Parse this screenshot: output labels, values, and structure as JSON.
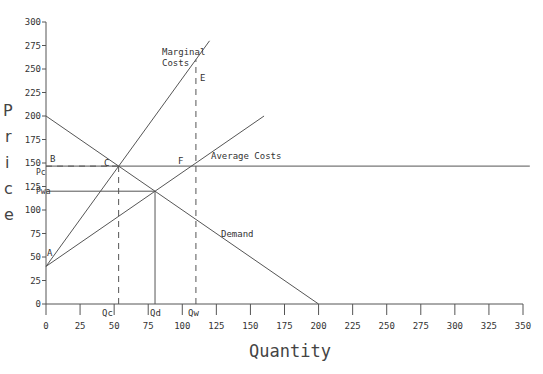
{
  "chart_data": {
    "type": "line",
    "title": "",
    "xlabel": "Quantity",
    "ylabel": "Price",
    "xlim": [
      0,
      350
    ],
    "ylim": [
      0,
      300
    ],
    "grid": false,
    "x_ticks": [
      0,
      25,
      50,
      75,
      100,
      125,
      150,
      175,
      200,
      225,
      250,
      275,
      300,
      325,
      350
    ],
    "y_ticks": [
      0,
      25,
      50,
      75,
      100,
      125,
      150,
      175,
      200,
      225,
      250,
      275,
      300
    ],
    "series": [
      {
        "name": "Marginal Costs",
        "x": [
          0,
          120
        ],
        "y": [
          40,
          280
        ]
      },
      {
        "name": "Average Costs",
        "x": [
          0,
          160
        ],
        "y": [
          40,
          200
        ]
      },
      {
        "name": "Demand",
        "x": [
          0,
          200
        ],
        "y": [
          200,
          0
        ]
      },
      {
        "name": "Pc price line",
        "x": [
          0,
          355
        ],
        "y": [
          146.7,
          146.7
        ]
      }
    ],
    "reference_lines": [
      {
        "name": "Pc",
        "type": "dashed-horizontal",
        "y": 146.7,
        "x_to": 53.3
      },
      {
        "name": "Pwa",
        "type": "solid-horizontal",
        "y": 120,
        "x_to": 80
      },
      {
        "name": "Qc",
        "type": "dashed-vertical",
        "x": 53.3,
        "y_to": 146.7
      },
      {
        "name": "Qd",
        "type": "solid-vertical",
        "x": 80,
        "y_to": 120
      },
      {
        "name": "Qw",
        "type": "dashed-vertical",
        "x": 110,
        "y_to": 260
      }
    ],
    "annotations": [
      {
        "text": "A",
        "x": 1,
        "y": 52
      },
      {
        "text": "B",
        "x": 1,
        "y": 150
      },
      {
        "text": "C",
        "x": 44,
        "y": 150
      },
      {
        "text": "E",
        "x": 113,
        "y": 243
      },
      {
        "text": "F",
        "x": 97,
        "y": 150
      },
      {
        "text": "Marginal Costs",
        "x": 85,
        "y": 258
      },
      {
        "text": "Average Costs",
        "x": 120,
        "y": 157
      },
      {
        "text": "Demand",
        "x": 127,
        "y": 73
      },
      {
        "text": "Pc",
        "x": 0,
        "y": 141
      },
      {
        "text": "Pwa",
        "x": 0,
        "y": 116
      },
      {
        "text": "Qc",
        "x": 44,
        "y": -6
      },
      {
        "text": "Qd",
        "x": 77,
        "y": -6
      },
      {
        "text": "Qw",
        "x": 107,
        "y": -6
      }
    ]
  },
  "labels": {
    "xlabel": "Quantity",
    "ylabel_chars": [
      "P",
      "r",
      "i",
      "c",
      "e"
    ],
    "mc_line1": "Marginal",
    "mc_line2": "Costs",
    "ac": "Average Costs",
    "demand": "Demand",
    "A": "A",
    "B": "B",
    "C": "C",
    "E": "E",
    "F": "F",
    "Pc": "Pc",
    "Pwa": "Pwa",
    "Qc": "Qc",
    "Qd": "Qd",
    "Qw": "Qw"
  },
  "colors": {
    "line": "#555555",
    "text": "#333333"
  }
}
